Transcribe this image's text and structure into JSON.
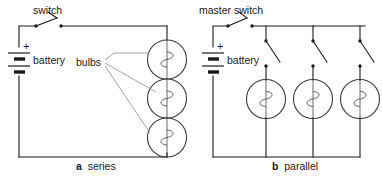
{
  "figure": {
    "width": 382,
    "height": 176,
    "background": "#ffffff",
    "wire_color": "#1a1a1a",
    "bulb_color": "#3a3a3a",
    "leader_color": "#9a9a9a"
  },
  "circuit_a": {
    "caption_letter": "a",
    "caption_text": "series",
    "switch_label": "switch",
    "battery_label": "battery",
    "bulbs_label": "bulbs",
    "polarity_label": "+",
    "bulb_count": 3,
    "switch_state": "open"
  },
  "circuit_b": {
    "caption_letter": "b",
    "caption_text": "parallel",
    "switch_label": "master switch",
    "battery_label": "battery",
    "polarity_label": "+",
    "bulb_count": 3,
    "branch_switch_count": 3,
    "switch_state": "open"
  },
  "icons": {
    "bulb": "lamp-icon",
    "battery": "battery-icon",
    "switch": "switch-icon"
  }
}
